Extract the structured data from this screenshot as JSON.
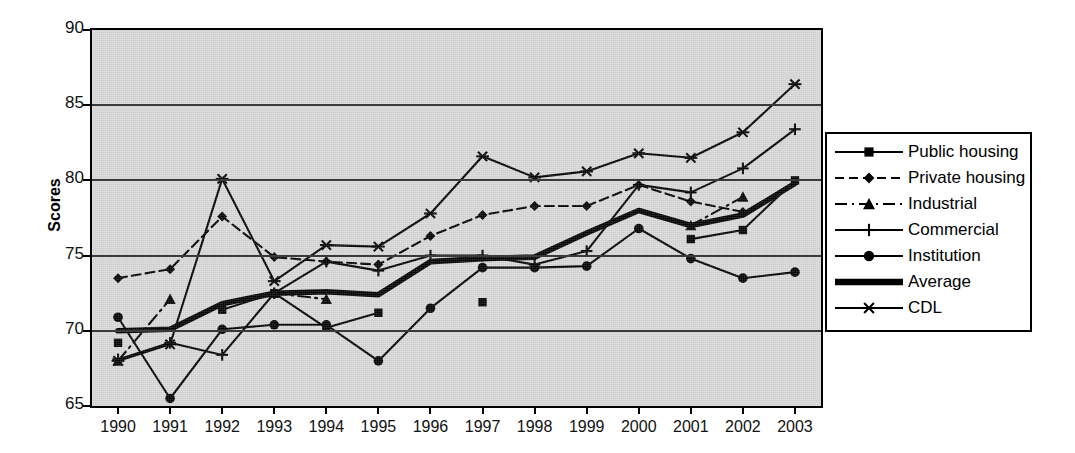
{
  "chart_data": {
    "type": "line",
    "title": "",
    "xlabel": "",
    "ylabel": "Scores",
    "ylim": [
      65,
      90
    ],
    "yticks": [
      65,
      70,
      75,
      80,
      85,
      90
    ],
    "grid": true,
    "legend_position": "right-outside",
    "plot_background": "#d9d9d9",
    "line_color": "#000000",
    "categories": [
      "1990",
      "1991",
      "1992",
      "1993",
      "1994",
      "1995",
      "1996",
      "1997",
      "1998",
      "1999",
      "2000",
      "2001",
      "2002",
      "2003"
    ],
    "series": [
      {
        "name": "Public housing",
        "marker": "square",
        "line_style": "solid",
        "values": [
          69.2,
          null,
          71.4,
          72.5,
          70.2,
          71.2,
          null,
          71.9,
          null,
          null,
          null,
          76.1,
          76.7,
          80.0
        ]
      },
      {
        "name": "Private housing",
        "marker": "diamond",
        "line_style": "dashed",
        "values": [
          73.5,
          74.1,
          77.6,
          74.9,
          74.6,
          74.4,
          76.3,
          77.7,
          78.3,
          78.3,
          79.7,
          78.6,
          77.9,
          null
        ]
      },
      {
        "name": "Industrial",
        "marker": "triangle",
        "line_style": "dash-dot",
        "values": [
          68.0,
          72.1,
          null,
          72.5,
          72.1,
          null,
          null,
          null,
          null,
          null,
          null,
          77.0,
          78.9,
          null
        ]
      },
      {
        "name": "Commercial",
        "marker": "plus",
        "line_style": "solid",
        "values": [
          68.1,
          69.2,
          68.4,
          72.5,
          74.6,
          74.0,
          75.0,
          75.0,
          74.4,
          75.3,
          79.7,
          79.2,
          80.8,
          83.4
        ]
      },
      {
        "name": "Institution",
        "marker": "circle",
        "line_style": "solid",
        "values": [
          70.9,
          65.5,
          70.1,
          70.4,
          70.4,
          68.0,
          71.5,
          74.2,
          74.2,
          74.3,
          76.8,
          74.8,
          73.5,
          73.9
        ]
      },
      {
        "name": "Average",
        "marker": "none",
        "line_style": "thick",
        "values": [
          70.0,
          70.1,
          71.8,
          72.5,
          72.6,
          72.4,
          74.6,
          74.8,
          74.9,
          76.5,
          78.0,
          77.0,
          77.7,
          79.8
        ]
      },
      {
        "name": "CDL",
        "marker": "asterisk",
        "line_style": "solid",
        "values": [
          68.0,
          69.1,
          80.1,
          73.3,
          75.7,
          75.6,
          77.8,
          81.6,
          80.2,
          80.6,
          81.8,
          81.5,
          83.2,
          86.4
        ]
      }
    ]
  },
  "legend": {
    "items": [
      {
        "label": "Public housing",
        "marker": "square",
        "style": "solid"
      },
      {
        "label": "Private housing",
        "marker": "diamond",
        "style": "dashed"
      },
      {
        "label": "Industrial",
        "marker": "triangle",
        "style": "dash-dot"
      },
      {
        "label": "Commercial",
        "marker": "plus",
        "style": "solid"
      },
      {
        "label": "Institution",
        "marker": "circle",
        "style": "solid"
      },
      {
        "label": "Average",
        "marker": "none",
        "style": "thick"
      },
      {
        "label": "CDL",
        "marker": "asterisk",
        "style": "solid"
      }
    ]
  }
}
